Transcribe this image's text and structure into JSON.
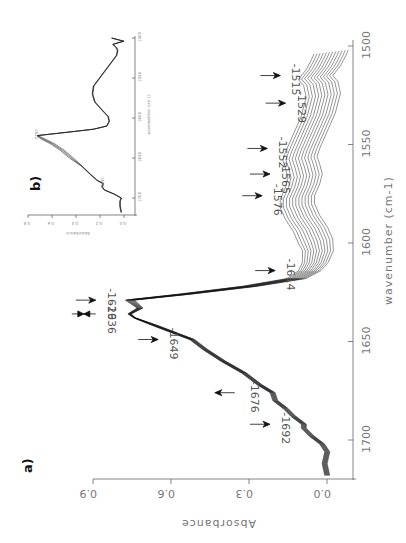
{
  "figure": {
    "orientation": "rotated 90 degrees counter-clockwise",
    "panel_a_label": "a)",
    "panel_b_label": "b)"
  },
  "chart_data": [
    {
      "panel": "a)",
      "type": "line",
      "title": "",
      "xlabel": "wavenumber (cm-1)",
      "ylabel": "Absorbance",
      "xlim": [
        1720,
        1495
      ],
      "ylim": [
        -0.05,
        0.95
      ],
      "x_ticks": [
        1700,
        1650,
        1600,
        1550,
        1500
      ],
      "y_ticks": [
        "0.0",
        "0.3",
        "0.6",
        "0.9"
      ],
      "grid": false,
      "legend": "none",
      "series_count": 12,
      "series_note": "family of stacked spectra; curves diverge progressively in 1500-1600 region",
      "base_series": {
        "x": [
          1718,
          1712,
          1706,
          1702,
          1698,
          1694,
          1692,
          1688,
          1684,
          1680,
          1676,
          1672,
          1666,
          1660,
          1654,
          1649,
          1646,
          1642,
          1638,
          1636,
          1633,
          1629,
          1626,
          1622,
          1618,
          1614,
          1610,
          1604,
          1598,
          1592,
          1586,
          1580,
          1576,
          1570,
          1565,
          1560,
          1556,
          1552,
          1546,
          1540,
          1534,
          1529,
          1524,
          1518,
          1515,
          1510,
          1505,
          1502
        ],
        "y": [
          0.0,
          0.01,
          0.0,
          0.02,
          0.06,
          0.09,
          0.09,
          0.13,
          0.16,
          0.2,
          0.21,
          0.26,
          0.32,
          0.4,
          0.47,
          0.52,
          0.58,
          0.66,
          0.74,
          0.76,
          0.72,
          0.76,
          0.55,
          0.3,
          0.12,
          0.07,
          0.05,
          0.04,
          0.05,
          0.07,
          0.1,
          0.12,
          0.12,
          0.1,
          0.09,
          0.1,
          0.11,
          0.1,
          0.08,
          0.06,
          0.04,
          0.03,
          0.02,
          0.03,
          0.05,
          0.02,
          0.0,
          -0.01
        ]
      },
      "offset_step": 0.012,
      "annotations": [
        {
          "label": "-1692",
          "wavenumber": 1692,
          "arrow": "right"
        },
        {
          "label": "-1676",
          "wavenumber": 1676,
          "arrow": "left"
        },
        {
          "label": "-1649",
          "wavenumber": 1649,
          "arrow": "right"
        },
        {
          "label": "-1636",
          "wavenumber": 1636,
          "arrow": "double"
        },
        {
          "label": "-1629",
          "wavenumber": 1629,
          "arrow": "right"
        },
        {
          "label": "-1614",
          "wavenumber": 1614,
          "arrow": "right"
        },
        {
          "label": "-1576",
          "wavenumber": 1576,
          "arrow": "right"
        },
        {
          "label": "-1565",
          "wavenumber": 1565,
          "arrow": "right"
        },
        {
          "label": "-1552",
          "wavenumber": 1552,
          "arrow": "right"
        },
        {
          "label": "-1529",
          "wavenumber": 1529,
          "arrow": "right"
        },
        {
          "label": "-1515",
          "wavenumber": 1515,
          "arrow": "right"
        }
      ]
    },
    {
      "panel": "b)",
      "type": "line",
      "title": "",
      "xlabel": "wavenumber (cm-1)",
      "ylabel": "Absorbance",
      "xlim": [
        1720,
        1500
      ],
      "ylim": [
        0,
        0.8
      ],
      "x_ticks": [
        1700,
        1650,
        1600,
        1550,
        1500
      ],
      "y_ticks": [
        "0.0",
        "0.2",
        "0.4",
        "0.6",
        "0.8"
      ],
      "grid": false,
      "legend": "none",
      "annotations": [
        {
          "label": "-1682",
          "wavenumber": 1682
        },
        {
          "label": "-1622",
          "wavenumber": 1622
        }
      ],
      "x": [
        1718,
        1710,
        1704,
        1700,
        1695,
        1690,
        1686,
        1682,
        1678,
        1670,
        1660,
        1650,
        1640,
        1632,
        1626,
        1622,
        1618,
        1614,
        1610,
        1604,
        1598,
        1590,
        1580,
        1570,
        1560,
        1550,
        1540,
        1530,
        1522,
        1516,
        1512,
        1508,
        1504,
        1500
      ],
      "y": [
        0.02,
        0.03,
        0.03,
        0.02,
        0.08,
        0.16,
        0.18,
        0.17,
        0.22,
        0.28,
        0.35,
        0.42,
        0.5,
        0.58,
        0.66,
        0.72,
        0.48,
        0.25,
        0.14,
        0.12,
        0.13,
        0.18,
        0.24,
        0.26,
        0.25,
        0.2,
        0.15,
        0.1,
        0.06,
        0.05,
        0.06,
        0.09,
        0.0,
        0.1
      ]
    }
  ]
}
